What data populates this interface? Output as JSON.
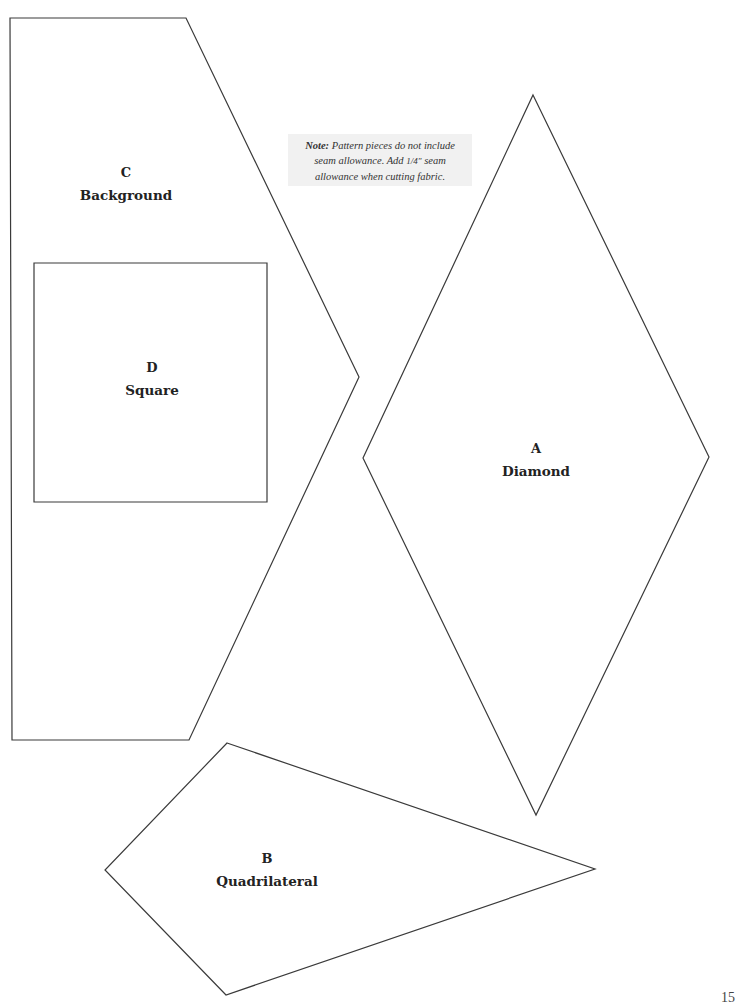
{
  "note": {
    "prefix": "Note:",
    "line1": "Pattern pieces do not include",
    "line2_a": "seam allowance. Add ",
    "fraction": "1/4\"",
    "line2_b": " seam",
    "line3": "allowance when cutting fabric."
  },
  "pieces": [
    {
      "id": "A",
      "letter": "A",
      "name": "Diamond",
      "points": "533,95 709,457 536,815 363,458"
    },
    {
      "id": "B",
      "letter": "B",
      "name": "Quadrilateral",
      "points": "227,743 595,869 226,995 105,870"
    },
    {
      "id": "C",
      "letter": "C",
      "name": "Background",
      "points": "10,18 186,18 359,377 189,740 12,740"
    },
    {
      "id": "D",
      "letter": "D",
      "name": "Square",
      "points": "34,263 267,263 267,502 34,502"
    }
  ],
  "page_number": "15",
  "colors": {
    "outline": "#3a3a3a",
    "note_background": "#f1f1f1",
    "text": "#222222"
  }
}
